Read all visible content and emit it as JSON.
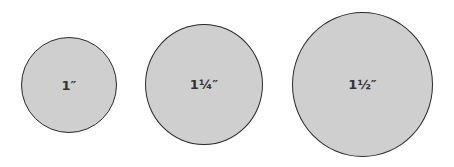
{
  "diagram": {
    "circles": [
      {
        "label": "1″",
        "color": "#cfcfcf"
      },
      {
        "label": "1¼″",
        "color": "#cfcfcf"
      },
      {
        "label": "1½″",
        "color": "#cfcfcf"
      }
    ]
  }
}
